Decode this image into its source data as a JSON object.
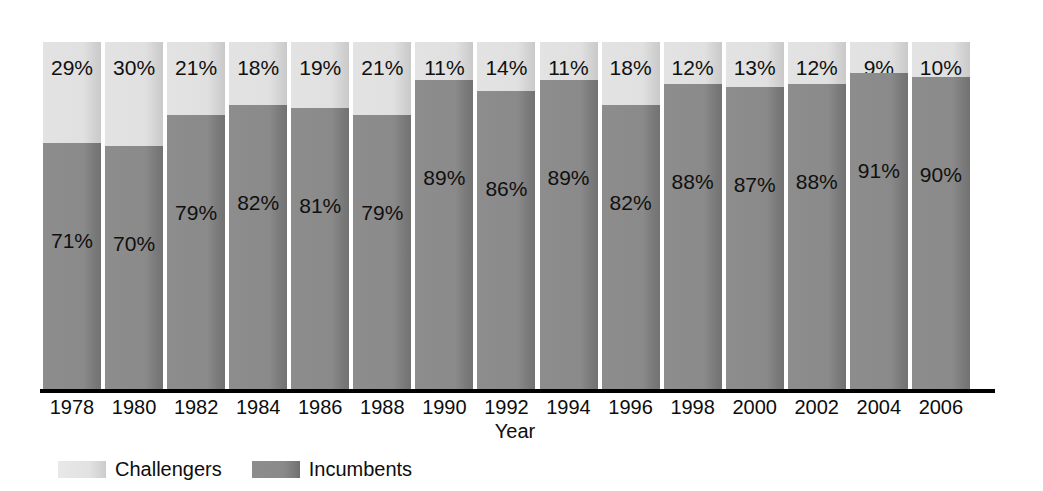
{
  "chart_data": {
    "type": "bar",
    "subtype": "stacked-percent",
    "title": "",
    "xlabel": "Year",
    "ylabel": "",
    "ylim": [
      0,
      100
    ],
    "grid": false,
    "legend_position": "bottom-left",
    "categories": [
      "1978",
      "1980",
      "1982",
      "1984",
      "1986",
      "1988",
      "1990",
      "1992",
      "1994",
      "1996",
      "1998",
      "2000",
      "2002",
      "2004",
      "2006"
    ],
    "series": [
      {
        "name": "Challengers",
        "color": "#e0e0e0",
        "values": [
          29,
          30,
          21,
          18,
          19,
          21,
          11,
          14,
          11,
          18,
          12,
          13,
          12,
          9,
          10
        ],
        "labels": [
          "29%",
          "30%",
          "21%",
          "18%",
          "19%",
          "21%",
          "11%",
          "14%",
          "11%",
          "18%",
          "12%",
          "13%",
          "12%",
          "9%",
          "10%"
        ]
      },
      {
        "name": "Incumbents",
        "color": "#8a8a8a",
        "values": [
          71,
          70,
          79,
          82,
          81,
          79,
          89,
          86,
          89,
          82,
          88,
          87,
          88,
          91,
          90
        ],
        "labels": [
          "71%",
          "70%",
          "79%",
          "82%",
          "81%",
          "79%",
          "89%",
          "86%",
          "89%",
          "82%",
          "88%",
          "87%",
          "88%",
          "91%",
          "90%"
        ]
      }
    ]
  },
  "axis": {
    "x_label": "Year"
  },
  "legend": {
    "items": [
      {
        "label": "Challengers",
        "color": "#e0e0e0"
      },
      {
        "label": "Incumbents",
        "color": "#8a8a8a"
      }
    ]
  }
}
